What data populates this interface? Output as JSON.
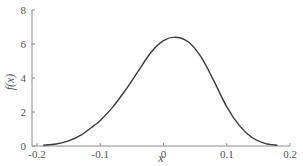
{
  "chart_data": {
    "type": "line",
    "title": "",
    "xlabel": "x",
    "ylabel": "f(x)",
    "xlim": [
      -0.2,
      0.2
    ],
    "ylim": [
      0,
      8
    ],
    "xticks": [
      -0.2,
      -0.1,
      0,
      0.1,
      0.2
    ],
    "xtick_labels": [
      "-0.2",
      "-0.1",
      "0",
      "0.1",
      "0.2"
    ],
    "yticks": [
      0,
      2,
      4,
      6,
      8
    ],
    "ytick_labels": [
      "0",
      "2",
      "4",
      "6",
      "8"
    ],
    "grid": false,
    "legend": null,
    "series": [
      {
        "name": "f(x)",
        "x": [
          -0.19,
          -0.17,
          -0.15,
          -0.13,
          -0.11,
          -0.1,
          -0.08,
          -0.06,
          -0.04,
          -0.02,
          0.0,
          0.02,
          0.04,
          0.06,
          0.08,
          0.1,
          0.12,
          0.14,
          0.16,
          0.18
        ],
        "y": [
          0.05,
          0.12,
          0.3,
          0.65,
          1.2,
          1.5,
          2.3,
          3.3,
          4.4,
          5.5,
          6.2,
          6.4,
          6.1,
          5.2,
          3.8,
          2.3,
          1.2,
          0.5,
          0.15,
          0.05
        ]
      }
    ]
  }
}
